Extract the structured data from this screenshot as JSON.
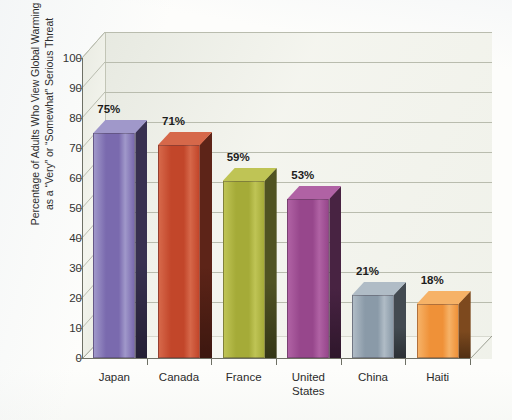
{
  "chart_data": {
    "type": "bar",
    "title": "",
    "subtitle": "",
    "xlabel": "",
    "ylabel": "Percentage of Adults Who View Global Warming\nas a “Very” or “Somewhat” Serious Threat",
    "categories": [
      "Japan",
      "Canada",
      "France",
      "United\nStates",
      "China",
      "Haiti"
    ],
    "values": [
      75,
      71,
      59,
      53,
      21,
      18
    ],
    "data_labels": [
      "75%",
      "71%",
      "59%",
      "53%",
      "21%",
      "18%"
    ],
    "ylim": [
      0,
      100
    ],
    "ytick_labels": [
      "0",
      "10",
      "20",
      "30",
      "40",
      "50",
      "60",
      "70",
      "80",
      "90",
      "100"
    ],
    "ytick_values": [
      0,
      10,
      20,
      30,
      40,
      50,
      60,
      70,
      80,
      90,
      100
    ],
    "grid": true,
    "legend": false,
    "legend_position": "none",
    "style": "3d-column",
    "series": [
      {
        "name": "Percentage of Adults Who View Global Warming as a Very or Somewhat Serious Threat",
        "values": [
          75,
          71,
          59,
          53,
          21,
          18
        ]
      }
    ],
    "bar_colors": [
      "#7a6aae",
      "#c2462a",
      "#a5ab38",
      "#97478c",
      "#8a9aa8",
      "#ef9138"
    ],
    "bar_colors_dark": [
      "#4e4276",
      "#8c2f1b",
      "#6f7425",
      "#6a2e61",
      "#5b6772",
      "#b8641d"
    ],
    "bar_colors_light": [
      "#a098ca",
      "#d6684a",
      "#bfc455",
      "#b062a4",
      "#b0bcc6",
      "#f6b267"
    ],
    "plot_background": "#f2f3ec",
    "gridline_color": "#b9bcae",
    "axis_color": "#6e7065",
    "page_background": "#fdfdfb"
  }
}
